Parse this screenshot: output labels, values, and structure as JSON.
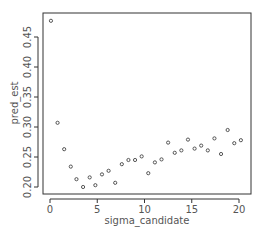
{
  "chart_data": {
    "type": "scatter",
    "title": "",
    "xlabel": "sigma_candidate",
    "ylabel": "pred_est",
    "xlim": [
      -0.8,
      21.0
    ],
    "ylim": [
      0.195,
      0.485
    ],
    "xticks": [
      0,
      5,
      10,
      15,
      20
    ],
    "yticks": [
      0.2,
      0.25,
      0.3,
      0.35,
      0.4,
      0.45
    ],
    "ytick_labels": [
      "0.20",
      "0.25",
      "0.30",
      "0.35",
      "0.40",
      "0.45"
    ],
    "grid": false,
    "marker": "open-circle",
    "x": [
      0.1,
      0.8,
      1.5,
      2.2,
      2.8,
      3.5,
      4.2,
      4.8,
      5.5,
      6.2,
      6.9,
      7.6,
      8.3,
      9.0,
      9.7,
      10.4,
      11.1,
      11.8,
      12.5,
      13.2,
      13.9,
      14.6,
      15.3,
      16.0,
      16.7,
      17.4,
      18.1,
      18.8,
      19.5,
      20.2
    ],
    "y": [
      0.477,
      0.307,
      0.263,
      0.234,
      0.213,
      0.2,
      0.216,
      0.203,
      0.221,
      0.227,
      0.207,
      0.238,
      0.245,
      0.245,
      0.251,
      0.223,
      0.241,
      0.246,
      0.274,
      0.257,
      0.261,
      0.279,
      0.264,
      0.269,
      0.261,
      0.281,
      0.255,
      0.295,
      0.273,
      0.278
    ]
  },
  "colors": {
    "points": "#444444",
    "axis": "#333333",
    "text": "#555555"
  }
}
